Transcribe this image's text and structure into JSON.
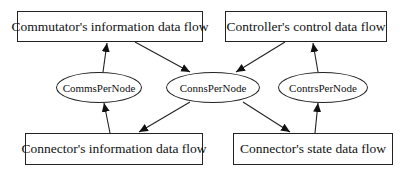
{
  "diagram": {
    "type": "data-flow-graph",
    "colors": {
      "background": "#ffffff",
      "stroke": "#222222",
      "text": "#111111"
    },
    "boxes": [
      {
        "id": "commutator_info",
        "label": "Commutator's information data flow"
      },
      {
        "id": "controller_control",
        "label": "Controller's control data flow"
      },
      {
        "id": "connector_info",
        "label": "Connector's information data flow"
      },
      {
        "id": "connector_state",
        "label": "Connector's state data flow"
      }
    ],
    "ellipses": [
      {
        "id": "comms_per_node",
        "label": "CommsPerNode"
      },
      {
        "id": "conns_per_node",
        "label": "ConnsPerNode"
      },
      {
        "id": "contrs_per_node",
        "label": "ContrsPerNode"
      }
    ],
    "edges": [
      {
        "from": "CommsPerNode",
        "to": "Commutator's information data flow"
      },
      {
        "from": "Commutator's information data flow",
        "to": "ConnsPerNode"
      },
      {
        "from": "Controller's control data flow",
        "to": "ConnsPerNode"
      },
      {
        "from": "ContrsPerNode",
        "to": "Controller's control data flow"
      },
      {
        "from": "Connector's information data flow",
        "to": "CommsPerNode"
      },
      {
        "from": "ConnsPerNode",
        "to": "Connector's information data flow"
      },
      {
        "from": "ConnsPerNode",
        "to": "Connector's state data flow"
      },
      {
        "from": "Connector's state data flow",
        "to": "ContrsPerNode"
      }
    ]
  }
}
